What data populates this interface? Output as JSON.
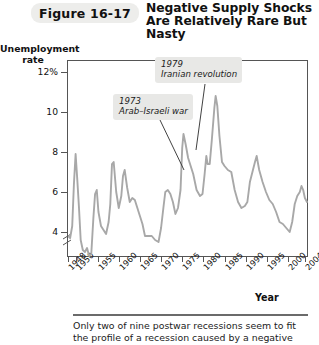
{
  "figure": {
    "number_label": "Figure 16-17",
    "title": "Negative Supply Shocks Are Relatively Rare But Nasty",
    "caption": "Only two of nine postwar recessions seem to fit the profile of a recession caused by a negative"
  },
  "axes": {
    "y_title": "Unemployment rate",
    "x_title": "Year",
    "y_ticks": [
      "12%",
      "10",
      "8",
      "6",
      "4"
    ],
    "y_tick_values": [
      12,
      10,
      8,
      6,
      4
    ],
    "x_ticks": [
      "1948",
      "1950",
      "1955",
      "1960",
      "1965",
      "1970",
      "1975",
      "1980",
      "1985",
      "1990",
      "1995",
      "2000",
      "2004"
    ],
    "x_tick_values": [
      1948,
      1950,
      1955,
      1960,
      1965,
      1970,
      1975,
      1980,
      1985,
      1990,
      1995,
      2000,
      2004
    ],
    "axis_break": true
  },
  "annotations": [
    {
      "id": "shock-1973",
      "year": "1973",
      "event": "Arab–Israeli war"
    },
    {
      "id": "shock-1979",
      "year": "1979",
      "event": "Iranian revolution"
    }
  ],
  "colors": {
    "series_line": "#a8a8a8",
    "axis": "#555555",
    "badge_bg": "#ededeb",
    "callout_bg": "#e8e8e6",
    "text": "#1b1b1b"
  },
  "chart_data": {
    "type": "line",
    "title": "Negative Supply Shocks Are Relatively Rare But Nasty",
    "xlabel": "Year",
    "ylabel": "Unemployment rate",
    "xlim": [
      1948,
      2004.5
    ],
    "ylim": [
      2.8,
      12.6
    ],
    "grid": false,
    "legend": "none",
    "series": [
      {
        "name": "U.S. civilian unemployment rate",
        "color": "#a8a8a8",
        "x": [
          1948.0,
          1948.5,
          1949.0,
          1949.4,
          1949.8,
          1950.2,
          1950.6,
          1951.0,
          1951.5,
          1952.0,
          1952.5,
          1953.0,
          1953.5,
          1954.0,
          1954.4,
          1954.8,
          1955.2,
          1955.8,
          1956.4,
          1957.0,
          1957.6,
          1958.0,
          1958.4,
          1958.8,
          1959.4,
          1960.0,
          1960.6,
          1961.0,
          1961.4,
          1962.0,
          1962.6,
          1963.2,
          1963.8,
          1964.4,
          1965.0,
          1965.6,
          1966.2,
          1967.0,
          1967.8,
          1968.6,
          1969.4,
          1970.0,
          1970.6,
          1971.0,
          1971.6,
          1972.2,
          1972.8,
          1973.4,
          1974.0,
          1974.6,
          1975.0,
          1975.3,
          1975.8,
          1976.4,
          1977.0,
          1977.6,
          1978.4,
          1979.2,
          1979.8,
          1980.3,
          1980.7,
          1981.0,
          1981.5,
          1982.0,
          1982.6,
          1982.9,
          1983.3,
          1983.8,
          1984.4,
          1985.0,
          1985.8,
          1986.6,
          1987.4,
          1988.2,
          1989.0,
          1989.8,
          1990.4,
          1991.0,
          1991.6,
          1992.2,
          1992.6,
          1993.2,
          1994.0,
          1994.8,
          1995.6,
          1996.4,
          1997.2,
          1998.0,
          1998.8,
          1999.6,
          2000.4,
          2001.0,
          2001.6,
          2002.2,
          2002.8,
          2003.2,
          2003.6,
          2004.0,
          2004.5
        ],
        "y": [
          3.8,
          3.7,
          4.3,
          6.4,
          7.9,
          6.6,
          5.2,
          3.6,
          3.1,
          3.0,
          3.2,
          2.8,
          2.9,
          4.7,
          5.9,
          6.1,
          5.0,
          4.3,
          4.1,
          3.9,
          4.5,
          5.4,
          7.4,
          7.5,
          6.0,
          5.2,
          5.8,
          6.8,
          7.1,
          6.2,
          5.5,
          5.7,
          5.6,
          5.2,
          4.8,
          4.4,
          3.8,
          3.8,
          3.8,
          3.6,
          3.5,
          4.2,
          5.3,
          6.0,
          6.1,
          5.9,
          5.5,
          4.9,
          5.2,
          6.1,
          8.2,
          8.9,
          8.4,
          7.7,
          7.3,
          6.9,
          6.1,
          5.8,
          5.9,
          6.9,
          7.8,
          7.4,
          7.4,
          8.6,
          10.2,
          10.8,
          10.3,
          8.8,
          7.5,
          7.3,
          7.1,
          7.0,
          6.1,
          5.5,
          5.2,
          5.3,
          5.5,
          6.5,
          7.0,
          7.5,
          7.8,
          7.1,
          6.5,
          6.0,
          5.6,
          5.4,
          5.0,
          4.5,
          4.4,
          4.2,
          4.0,
          4.5,
          5.4,
          5.8,
          6.0,
          6.3,
          6.1,
          5.7,
          5.5
        ],
        "peaks": [
          {
            "year": 1949.8,
            "value": 7.9
          },
          {
            "year": 1954.8,
            "value": 6.1
          },
          {
            "year": 1958.4,
            "value": 7.5
          },
          {
            "year": 1961.4,
            "value": 7.1
          },
          {
            "year": 1975.3,
            "value": 8.9
          },
          {
            "year": 1982.9,
            "value": 10.8
          },
          {
            "year": 1992.6,
            "value": 7.8
          },
          {
            "year": 2003.2,
            "value": 6.3
          }
        ]
      }
    ],
    "annotations": [
      {
        "label": "1973 Arab–Israeli war",
        "points_to_year": 1975.0,
        "points_to_value": 8.2
      },
      {
        "label": "1979 Iranian revolution",
        "points_to_year": 1980.3,
        "points_to_value": 6.9
      }
    ]
  }
}
